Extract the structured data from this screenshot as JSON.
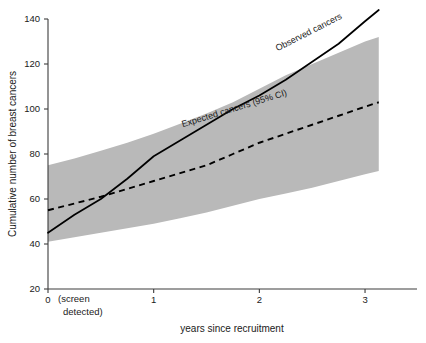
{
  "chart_data": {
    "type": "line",
    "title": "",
    "xlabel": "years since recruitment",
    "ylabel": "Cumulative number of breast cancers",
    "xlim": [
      0,
      3.17
    ],
    "ylim": [
      20,
      140
    ],
    "grid": false,
    "legend_position": "inline-annotations",
    "x_tick_labels": [
      "0",
      "1",
      "2",
      "3"
    ],
    "x_tick_values": [
      0,
      1,
      2,
      3
    ],
    "x_tick_note_line1": "(screen",
    "x_tick_note_line2": "detected)",
    "y_tick_labels": [
      "20",
      "40",
      "60",
      "80",
      "100",
      "120",
      "140"
    ],
    "y_tick_values": [
      20,
      40,
      60,
      80,
      100,
      120,
      140
    ],
    "series": [
      {
        "name": "Observed cancers",
        "style": "solid",
        "color": "#000000",
        "x": [
          0,
          0.25,
          0.5,
          0.75,
          1.0,
          1.25,
          1.5,
          1.75,
          2.0,
          2.25,
          2.5,
          2.75,
          3.0,
          3.13
        ],
        "values": [
          45,
          53,
          60,
          69,
          79,
          86,
          93,
          100,
          106,
          113,
          121,
          129,
          139,
          144
        ]
      },
      {
        "name": "Expected cancers (95% CI)",
        "style": "dashed",
        "color": "#000000",
        "x": [
          0,
          0.25,
          0.5,
          0.75,
          1.0,
          1.25,
          1.5,
          1.75,
          2.0,
          2.25,
          2.5,
          2.75,
          3.0,
          3.13
        ],
        "values": [
          55,
          58,
          61,
          64.5,
          68,
          71.5,
          75,
          80,
          85,
          89,
          93,
          97,
          101,
          103
        ],
        "ci_upper": [
          75,
          78,
          81.5,
          85,
          89,
          93.5,
          98,
          103,
          109,
          115,
          120,
          125,
          130,
          132
        ],
        "ci_lower": [
          41,
          43,
          45,
          47,
          49,
          51.5,
          54,
          57,
          60,
          62.5,
          65,
          68,
          71,
          72.5
        ],
        "ci_fill_color": "#b9b9b9"
      }
    ],
    "annotations": [
      {
        "text": "Observed cancers",
        "x": 2.48,
        "y": 133,
        "rotation": -27
      },
      {
        "text": "Expected cancers (95% CI)",
        "x": 1.77,
        "y": 99,
        "rotation": -17
      }
    ]
  }
}
